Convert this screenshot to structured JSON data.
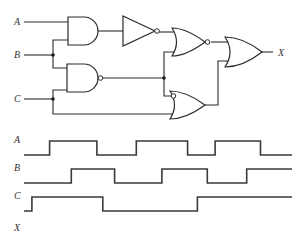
{
  "circuit": {
    "inputs": [
      {
        "name": "A",
        "label": "A"
      },
      {
        "name": "B",
        "label": "B"
      },
      {
        "name": "C",
        "label": "C"
      }
    ],
    "output": {
      "name": "X",
      "label": "X"
    },
    "gates": [
      {
        "id": "g1",
        "type": "AND",
        "inputs": [
          "A",
          "B"
        ]
      },
      {
        "id": "g2",
        "type": "NOT",
        "inputs": [
          "g1"
        ]
      },
      {
        "id": "g3",
        "type": "NAND",
        "inputs": [
          "B",
          "C"
        ]
      },
      {
        "id": "g4",
        "type": "NOR",
        "inputs": [
          "g2",
          "g3"
        ]
      },
      {
        "id": "g5",
        "type": "OR",
        "inputs": [
          "NOT g3",
          "C"
        ],
        "inverted_inputs": [
          "g3"
        ]
      },
      {
        "id": "g6",
        "type": "OR",
        "inputs": [
          "g4",
          "g5"
        ]
      }
    ],
    "colors": {
      "line": "#2a2a2a",
      "background": "#ffffff"
    }
  },
  "timing": {
    "signals": [
      {
        "name": "A",
        "label": "A",
        "initial": 0,
        "transitions": [
          0.13,
          0.37,
          0.57,
          0.83,
          0.97,
          1.2
        ]
      },
      {
        "name": "B",
        "label": "B",
        "initial": 0,
        "transitions": [
          0.24,
          0.46,
          0.7,
          0.93,
          1.13
        ]
      },
      {
        "name": "C",
        "label": "C",
        "initial": 0,
        "transitions": [
          0.04,
          0.4,
          0.88
        ]
      },
      {
        "name": "X",
        "label": "X",
        "initial": null,
        "transitions": []
      }
    ],
    "time_range": [
      0,
      1.36
    ]
  }
}
